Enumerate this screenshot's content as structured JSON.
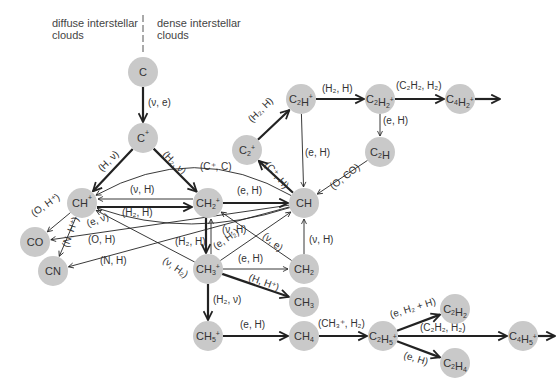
{
  "regions": {
    "left": [
      "diffuse interstellar",
      "clouds"
    ],
    "right": [
      "dense interstellar",
      "clouds"
    ]
  },
  "colors": {
    "node_fill": "#c9c9c9",
    "line": "#222222",
    "text": "#333333"
  },
  "nodes": [
    {
      "id": "C",
      "label": [
        [
          "C",
          ""
        ]
      ],
      "x": 143,
      "y": 72
    },
    {
      "id": "Cp",
      "label": [
        [
          "C",
          ""
        ],
        [
          "+",
          "sup"
        ]
      ],
      "x": 143,
      "y": 138
    },
    {
      "id": "CHp",
      "label": [
        [
          "CH",
          ""
        ],
        [
          "+",
          "sup"
        ]
      ],
      "x": 82,
      "y": 203
    },
    {
      "id": "CH2p",
      "label": [
        [
          "CH",
          ""
        ],
        [
          "2",
          "sub"
        ],
        [
          "+",
          "sup"
        ]
      ],
      "x": 208,
      "y": 203
    },
    {
      "id": "CH",
      "label": [
        [
          "CH",
          ""
        ]
      ],
      "x": 304,
      "y": 203
    },
    {
      "id": "C2p",
      "label": [
        [
          "C",
          ""
        ],
        [
          "2",
          "sub"
        ],
        [
          "+",
          "sup"
        ]
      ],
      "x": 247,
      "y": 150
    },
    {
      "id": "C2Hp",
      "label": [
        [
          "C",
          ""
        ],
        [
          "2",
          "sub"
        ],
        [
          "H",
          ""
        ],
        [
          "+",
          "sup"
        ]
      ],
      "x": 301,
      "y": 99
    },
    {
      "id": "C2H2p",
      "label": [
        [
          "C",
          ""
        ],
        [
          "2",
          "sub"
        ],
        [
          "H",
          ""
        ],
        [
          "2",
          "sub"
        ],
        [
          "+",
          "sup"
        ]
      ],
      "x": 380,
      "y": 99
    },
    {
      "id": "C4H2p",
      "label": [
        [
          "C",
          ""
        ],
        [
          "4",
          "sub"
        ],
        [
          "H",
          ""
        ],
        [
          "2",
          "sub"
        ],
        [
          "+",
          "sup"
        ]
      ],
      "x": 460,
      "y": 99
    },
    {
      "id": "C2H",
      "label": [
        [
          "C",
          ""
        ],
        [
          "2",
          "sub"
        ],
        [
          "H",
          ""
        ]
      ],
      "x": 380,
      "y": 152
    },
    {
      "id": "CO",
      "label": [
        [
          "CO",
          ""
        ]
      ],
      "x": 35,
      "y": 242
    },
    {
      "id": "CN",
      "label": [
        [
          "CN",
          ""
        ]
      ],
      "x": 53,
      "y": 271
    },
    {
      "id": "CH3p",
      "label": [
        [
          "CH",
          ""
        ],
        [
          "3",
          "sub"
        ],
        [
          "+",
          "sup"
        ]
      ],
      "x": 208,
      "y": 269
    },
    {
      "id": "CH2",
      "label": [
        [
          "CH",
          ""
        ],
        [
          "2",
          "sub"
        ]
      ],
      "x": 304,
      "y": 269
    },
    {
      "id": "CH3",
      "label": [
        [
          "CH",
          ""
        ],
        [
          "3",
          "sub"
        ]
      ],
      "x": 304,
      "y": 302
    },
    {
      "id": "CH5p",
      "label": [
        [
          "CH",
          ""
        ],
        [
          "5",
          "sub"
        ],
        [
          "+",
          "sup"
        ]
      ],
      "x": 208,
      "y": 336
    },
    {
      "id": "CH4",
      "label": [
        [
          "CH",
          ""
        ],
        [
          "4",
          "sub"
        ]
      ],
      "x": 304,
      "y": 336
    },
    {
      "id": "C2H5p",
      "label": [
        [
          "C",
          ""
        ],
        [
          "2",
          "sub"
        ],
        [
          "H",
          ""
        ],
        [
          "5",
          "sub"
        ],
        [
          "+",
          "sup"
        ]
      ],
      "x": 383,
      "y": 336
    },
    {
      "id": "C2H2",
      "label": [
        [
          "C",
          ""
        ],
        [
          "2",
          "sub"
        ],
        [
          "H",
          ""
        ],
        [
          "2",
          "sub"
        ]
      ],
      "x": 455,
      "y": 309
    },
    {
      "id": "C4H5p",
      "label": [
        [
          "C",
          ""
        ],
        [
          "4",
          "sub"
        ],
        [
          "H",
          ""
        ],
        [
          "5",
          "sub"
        ],
        [
          "+",
          "sup"
        ]
      ],
      "x": 523,
      "y": 336
    },
    {
      "id": "C2H4",
      "label": [
        [
          "C",
          ""
        ],
        [
          "2",
          "sub"
        ],
        [
          "H",
          ""
        ],
        [
          "4",
          "sub"
        ]
      ],
      "x": 455,
      "y": 363
    }
  ],
  "edges": [
    {
      "from": "C",
      "to": "Cp",
      "label": "(ν, e)",
      "w": "thick",
      "lx": 148,
      "ly": 106,
      "rot": 0
    },
    {
      "from": "Cp",
      "to": "CHp",
      "label": "(H, ν)",
      "w": "thick",
      "lx": 102,
      "ly": 172,
      "rot": -45
    },
    {
      "from": "Cp",
      "to": "CH2p",
      "label": "(H₂, ν)",
      "w": "thick",
      "lx": 162,
      "ly": 155,
      "rot": 45
    },
    {
      "from": "CH2p",
      "to": "CHp",
      "label": "(ν, H)",
      "w": "thin",
      "lx": 130,
      "ly": 193,
      "rot": 0,
      "dy": -4
    },
    {
      "from": "CHp",
      "to": "CH2p",
      "label": "(H₂, H)",
      "w": "thick",
      "lx": 122,
      "ly": 216,
      "rot": 0,
      "dy": 4
    },
    {
      "from": "CH2p",
      "to": "CH",
      "label": "(e, H)",
      "w": "thick",
      "lx": 237,
      "ly": 194,
      "rot": 0
    },
    {
      "from": "CH",
      "to": "CHp",
      "label": "(C⁺, C)",
      "w": "thin",
      "lx": 200,
      "ly": 170,
      "rot": 0,
      "curve": [
        195,
        140
      ]
    },
    {
      "from": "CH",
      "to": "C2p",
      "label": "(C⁺, H)",
      "w": "thick",
      "lx": 264,
      "ly": 165,
      "rot": 50
    },
    {
      "from": "C2p",
      "to": "C2Hp",
      "label": "(H₂, H)",
      "w": "thick",
      "lx": 252,
      "ly": 123,
      "rot": -45
    },
    {
      "from": "C2Hp",
      "to": "C2H2p",
      "label": "(H₂, H)",
      "w": "thick",
      "lx": 322,
      "ly": 92,
      "rot": 0
    },
    {
      "from": "C2H2p",
      "to": "C4H2p",
      "label": "(C₂H₂, H₂)",
      "w": "thick",
      "lx": 396,
      "ly": 89,
      "rot": 0
    },
    {
      "from": "C4H2p",
      "to": "OUT1",
      "label": "",
      "w": "thick",
      "tx": 500,
      "ty": 99
    },
    {
      "from": "C2Hp",
      "to": "CH",
      "label": "(e, H)",
      "w": "thin",
      "lx": 305,
      "ly": 156,
      "rot": 0
    },
    {
      "from": "C2H2p",
      "to": "C2H",
      "label": "(e, H)",
      "w": "thin",
      "lx": 383,
      "ly": 124,
      "rot": 0
    },
    {
      "from": "C2H",
      "to": "CH",
      "label": "(O, CO)",
      "w": "thin",
      "lx": 333,
      "ly": 190,
      "rot": -38
    },
    {
      "from": "CHp",
      "to": "CO",
      "label": "(O, H⁺)",
      "w": "thin",
      "lx": 34,
      "ly": 217,
      "rot": -35
    },
    {
      "from": "CHp",
      "to": "CN",
      "label": "(N, H⁺)",
      "w": "thin",
      "lx": 68,
      "ly": 248,
      "rot": -70
    },
    {
      "from": "CH",
      "to": "CO",
      "label": "(O, H)",
      "w": "thin",
      "lx": 88,
      "ly": 243,
      "rot": 0
    },
    {
      "from": "CH",
      "to": "CN",
      "label": "(N, H)",
      "w": "thin",
      "lx": 100,
      "ly": 264,
      "rot": 0
    },
    {
      "from": "CH",
      "to": "CHp",
      "label": "(e, ν)",
      "w": "thin",
      "lx": 88,
      "ly": 227,
      "rot": -20,
      "curve": [
        190,
        240
      ]
    },
    {
      "from": "CH3p",
      "to": "CHp",
      "label": "(ν, H₂)",
      "w": "thin",
      "lx": 162,
      "ly": 262,
      "rot": 35
    },
    {
      "from": "CH2p",
      "to": "CH3p",
      "label": "(H₂, H)",
      "w": "thick",
      "lx": 175,
      "ly": 245,
      "rot": 0,
      "dx": -2
    },
    {
      "from": "CH3p",
      "to": "CH2p",
      "label": "(ν, H)",
      "w": "thin",
      "lx": 222,
      "ly": 233,
      "rot": 0,
      "dx": 3
    },
    {
      "from": "CH3p",
      "to": "CH",
      "label": "(e, H₂)",
      "w": "thin",
      "lx": 216,
      "ly": 250,
      "rot": -35
    },
    {
      "from": "CH2",
      "to": "CH2p",
      "label": "(ν, e)",
      "w": "thin",
      "lx": 262,
      "ly": 237,
      "rot": 40
    },
    {
      "from": "CH2",
      "to": "CH",
      "label": "(ν, H)",
      "w": "thin",
      "lx": 309,
      "ly": 243,
      "rot": 0
    },
    {
      "from": "CH3p",
      "to": "CH2",
      "label": "(e, H)",
      "w": "thin",
      "lx": 238,
      "ly": 262,
      "rot": 0
    },
    {
      "from": "CH3p",
      "to": "CH3",
      "label": "(H, H⁺)",
      "w": "thick",
      "lx": 248,
      "ly": 280,
      "rot": 20
    },
    {
      "from": "CH3p",
      "to": "CH5p",
      "label": "(H₂, ν)",
      "w": "thick",
      "lx": 213,
      "ly": 303,
      "rot": 0
    },
    {
      "from": "CH5p",
      "to": "CH4",
      "label": "(e, H)",
      "w": "thick",
      "lx": 240,
      "ly": 328,
      "rot": 0
    },
    {
      "from": "CH4",
      "to": "C2H5p",
      "label": "(CH₃⁺, H₂)",
      "w": "thick",
      "lx": 318,
      "ly": 327,
      "rot": 0
    },
    {
      "from": "C2H5p",
      "to": "C2H2",
      "label": "(e, H₂ + H)",
      "w": "thick",
      "lx": 391,
      "ly": 318,
      "rot": -17
    },
    {
      "from": "C2H5p",
      "to": "C4H5p",
      "label": "(C₂H₂, H₂)",
      "w": "thick",
      "lx": 420,
      "ly": 331,
      "rot": 0
    },
    {
      "from": "C2H5p",
      "to": "C2H4",
      "label": "(e, H)",
      "w": "thick",
      "lx": 403,
      "ly": 358,
      "rot": 17
    },
    {
      "from": "C4H5p",
      "to": "OUT2",
      "label": "",
      "w": "thick",
      "tx": 555,
      "ty": 336
    }
  ]
}
